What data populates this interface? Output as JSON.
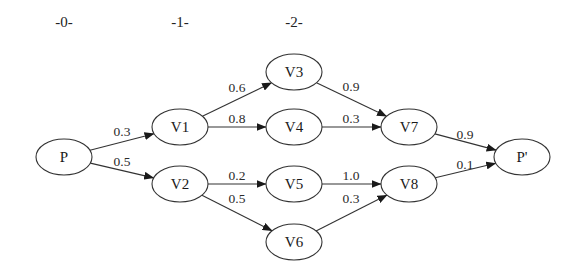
{
  "diagram": {
    "type": "directed-weighted-graph",
    "column_headers": [
      {
        "label": "-0-",
        "x": 64,
        "y": 27
      },
      {
        "label": "-1-",
        "x": 180,
        "y": 27
      },
      {
        "label": "-2-",
        "x": 294,
        "y": 27
      }
    ],
    "nodes": [
      {
        "id": "P",
        "label": "P",
        "cx": 64,
        "cy": 157,
        "rx": 28,
        "ry": 18
      },
      {
        "id": "V1",
        "label": "V1",
        "cx": 180,
        "cy": 127,
        "rx": 28,
        "ry": 18
      },
      {
        "id": "V2",
        "label": "V2",
        "cx": 180,
        "cy": 184,
        "rx": 28,
        "ry": 18
      },
      {
        "id": "V3",
        "label": "V3",
        "cx": 294,
        "cy": 72,
        "rx": 28,
        "ry": 18
      },
      {
        "id": "V4",
        "label": "V4",
        "cx": 294,
        "cy": 127,
        "rx": 28,
        "ry": 18
      },
      {
        "id": "V5",
        "label": "V5",
        "cx": 294,
        "cy": 184,
        "rx": 28,
        "ry": 18
      },
      {
        "id": "V6",
        "label": "V6",
        "cx": 294,
        "cy": 242,
        "rx": 28,
        "ry": 18
      },
      {
        "id": "V7",
        "label": "V7",
        "cx": 409,
        "cy": 127,
        "rx": 28,
        "ry": 18
      },
      {
        "id": "V8",
        "label": "V8",
        "cx": 409,
        "cy": 184,
        "rx": 28,
        "ry": 18
      },
      {
        "id": "Pp",
        "label": "P'",
        "cx": 522,
        "cy": 157,
        "rx": 28,
        "ry": 18
      }
    ],
    "edges": [
      {
        "from": "P",
        "to": "V1",
        "weight": "0.3",
        "lx": 122,
        "ly": 136
      },
      {
        "from": "P",
        "to": "V2",
        "weight": "0.5",
        "lx": 122,
        "ly": 166
      },
      {
        "from": "V1",
        "to": "V3",
        "weight": "0.6",
        "lx": 237,
        "ly": 92
      },
      {
        "from": "V1",
        "to": "V4",
        "weight": "0.8",
        "lx": 237,
        "ly": 123
      },
      {
        "from": "V2",
        "to": "V5",
        "weight": "0.2",
        "lx": 237,
        "ly": 180
      },
      {
        "from": "V2",
        "to": "V6",
        "weight": "0.5",
        "lx": 237,
        "ly": 203
      },
      {
        "from": "V3",
        "to": "V7",
        "weight": "0.9",
        "lx": 351,
        "ly": 91
      },
      {
        "from": "V4",
        "to": "V7",
        "weight": "0.3",
        "lx": 351,
        "ly": 123
      },
      {
        "from": "V5",
        "to": "V8",
        "weight": "1.0",
        "lx": 351,
        "ly": 180
      },
      {
        "from": "V6",
        "to": "V8",
        "weight": "0.3",
        "lx": 351,
        "ly": 203
      },
      {
        "from": "V7",
        "to": "Pp",
        "weight": "0.9",
        "lx": 465,
        "ly": 139
      },
      {
        "from": "V8",
        "to": "Pp",
        "weight": "0.1",
        "lx": 465,
        "ly": 169
      }
    ]
  },
  "colors": {
    "background": "#ffffff",
    "stroke": "#333333",
    "text": "#1a1a1a"
  }
}
